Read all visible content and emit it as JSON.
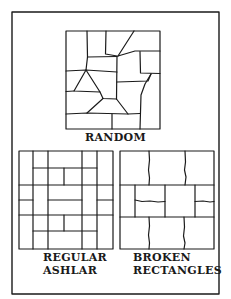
{
  "figure": {
    "panels": [
      {
        "id": "random",
        "label": "RANDOM"
      },
      {
        "id": "regular-ashlar",
        "label_lines": [
          "REGULAR",
          "ASHLAR"
        ]
      },
      {
        "id": "broken-rectangles",
        "label_lines": [
          "BROKEN",
          "RECTANGLES"
        ]
      }
    ],
    "colors": {
      "line": "#1a1a1a",
      "background": "#ffffff"
    }
  }
}
